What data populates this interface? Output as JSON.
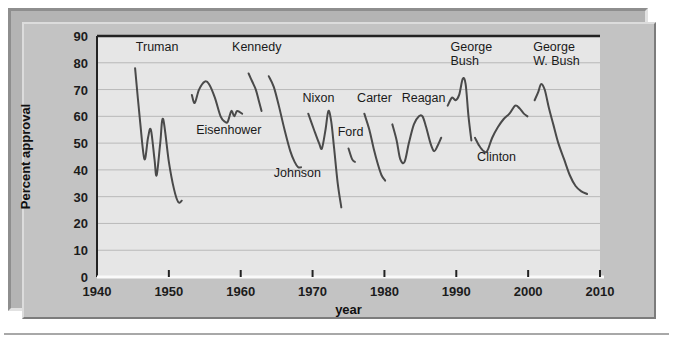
{
  "figure": {
    "background_color": "#c3c3c3",
    "plot_background_color": "#e6e6e6",
    "frame_color": "#b4b4b4",
    "line_color": "#4a4a4a",
    "grid_color": "#b9b9b9"
  },
  "chart_data": {
    "type": "line",
    "title": "",
    "xlabel": "year",
    "ylabel": "Percent approval",
    "xlim": [
      1940,
      2010
    ],
    "ylim": [
      0,
      90
    ],
    "xticks": [
      1940,
      1950,
      1960,
      1970,
      1980,
      1990,
      2000,
      2010
    ],
    "yticks": [
      0,
      10,
      20,
      30,
      40,
      50,
      60,
      70,
      80,
      90
    ],
    "grid": true,
    "legend": "inline-annotations",
    "series": [
      {
        "name": "Truman",
        "label": "Truman",
        "label_x": 1945.4,
        "label_y": 84.5,
        "label_anchor": "start",
        "points": [
          [
            1945.3,
            78
          ],
          [
            1946.0,
            58
          ],
          [
            1946.6,
            44
          ],
          [
            1947.1,
            52
          ],
          [
            1947.5,
            55
          ],
          [
            1948.0,
            44
          ],
          [
            1948.3,
            38
          ],
          [
            1948.8,
            50
          ],
          [
            1949.2,
            59
          ],
          [
            1950.0,
            43
          ],
          [
            1950.7,
            33
          ],
          [
            1951.3,
            28
          ],
          [
            1951.8,
            28.5
          ]
        ]
      },
      {
        "name": "Eisenhower",
        "label": "Eisenhower",
        "label_x": 1953.8,
        "label_y": 53.5,
        "label_anchor": "start",
        "points": [
          [
            1953.2,
            68
          ],
          [
            1953.6,
            65
          ],
          [
            1954.2,
            70
          ],
          [
            1955.0,
            73
          ],
          [
            1955.6,
            72
          ],
          [
            1956.4,
            67
          ],
          [
            1957.2,
            60
          ],
          [
            1957.8,
            58
          ],
          [
            1958.2,
            58
          ],
          [
            1958.7,
            62
          ],
          [
            1959.1,
            60
          ],
          [
            1959.5,
            62
          ],
          [
            1960.2,
            61
          ]
        ]
      },
      {
        "name": "Kennedy",
        "label": "Kennedy",
        "label_x": 1958.8,
        "label_y": 84.5,
        "label_anchor": "start",
        "points": [
          [
            1961.1,
            76
          ],
          [
            1961.6,
            73
          ],
          [
            1962.1,
            70
          ],
          [
            1962.5,
            66
          ],
          [
            1962.9,
            62
          ]
        ]
      },
      {
        "name": "Johnson",
        "label": "Johnson",
        "label_x": 1964.6,
        "label_y": 37.5,
        "label_anchor": "start",
        "points": [
          [
            1963.9,
            75
          ],
          [
            1964.6,
            71
          ],
          [
            1965.3,
            64
          ],
          [
            1966.1,
            55
          ],
          [
            1966.9,
            47
          ],
          [
            1967.5,
            43
          ],
          [
            1968.0,
            41
          ],
          [
            1968.4,
            41
          ]
        ]
      },
      {
        "name": "Nixon",
        "label": "Nixon",
        "label_x": 1968.6,
        "label_y": 65.5,
        "label_anchor": "start",
        "points": [
          [
            1969.4,
            61
          ],
          [
            1970.2,
            55
          ],
          [
            1970.9,
            50
          ],
          [
            1971.3,
            48
          ],
          [
            1971.8,
            55
          ],
          [
            1972.2,
            62
          ],
          [
            1972.6,
            58
          ],
          [
            1973.0,
            48
          ],
          [
            1973.5,
            35
          ],
          [
            1974.0,
            26
          ]
        ]
      },
      {
        "name": "Ford",
        "label": "Ford",
        "label_x": 1973.5,
        "label_y": 52.5,
        "label_anchor": "start",
        "points": [
          [
            1975.0,
            48
          ],
          [
            1975.5,
            44
          ],
          [
            1975.9,
            43
          ]
        ]
      },
      {
        "name": "Carter",
        "label": "Carter",
        "label_x": 1976.2,
        "label_y": 65.5,
        "label_anchor": "start",
        "points": [
          [
            1977.2,
            61
          ],
          [
            1977.9,
            55
          ],
          [
            1978.5,
            48
          ],
          [
            1979.1,
            42
          ],
          [
            1979.6,
            38
          ],
          [
            1980.1,
            36
          ]
        ]
      },
      {
        "name": "Reagan",
        "label": "Reagan",
        "label_x": 1982.4,
        "label_y": 65.5,
        "label_anchor": "start",
        "points": [
          [
            1981.1,
            57
          ],
          [
            1981.7,
            51
          ],
          [
            1982.2,
            44
          ],
          [
            1982.8,
            43
          ],
          [
            1983.4,
            50
          ],
          [
            1984.1,
            57
          ],
          [
            1984.8,
            60
          ],
          [
            1985.3,
            60
          ],
          [
            1985.8,
            56
          ],
          [
            1986.4,
            50
          ],
          [
            1986.9,
            47
          ],
          [
            1987.4,
            49
          ],
          [
            1987.9,
            52
          ]
        ]
      },
      {
        "name": "George Bush",
        "label": "George\nBush",
        "label_x": 1989.2,
        "label_y": 84.5,
        "label_anchor": "start",
        "points": [
          [
            1988.8,
            64
          ],
          [
            1989.4,
            67
          ],
          [
            1989.9,
            66
          ],
          [
            1990.4,
            68
          ],
          [
            1990.9,
            74
          ],
          [
            1991.3,
            72
          ],
          [
            1991.7,
            60
          ],
          [
            1992.1,
            51
          ]
        ]
      },
      {
        "name": "Clinton",
        "label": "Clinton",
        "label_x": 1992.9,
        "label_y": 43.5,
        "label_anchor": "start",
        "points": [
          [
            1992.6,
            52
          ],
          [
            1993.2,
            49
          ],
          [
            1993.8,
            47
          ],
          [
            1994.3,
            47
          ],
          [
            1995.0,
            52
          ],
          [
            1995.8,
            56
          ],
          [
            1996.6,
            59
          ],
          [
            1997.4,
            61
          ],
          [
            1998.2,
            64
          ],
          [
            1998.8,
            63
          ],
          [
            1999.4,
            61
          ],
          [
            1999.9,
            60
          ]
        ]
      },
      {
        "name": "George W. Bush",
        "label": "George\nW. Bush",
        "label_x": 2000.7,
        "label_y": 84.5,
        "label_anchor": "start",
        "points": [
          [
            2000.9,
            66
          ],
          [
            2001.4,
            69
          ],
          [
            2001.8,
            72
          ],
          [
            2002.3,
            70
          ],
          [
            2002.9,
            63
          ],
          [
            2003.5,
            57
          ],
          [
            2004.2,
            50
          ],
          [
            2005.0,
            44
          ],
          [
            2005.8,
            38
          ],
          [
            2006.6,
            34
          ],
          [
            2007.4,
            32
          ],
          [
            2008.2,
            31
          ]
        ]
      }
    ]
  },
  "plot_geometry": {
    "left": 97,
    "top": 36,
    "right": 600,
    "bottom": 277
  }
}
